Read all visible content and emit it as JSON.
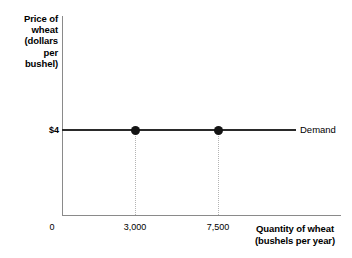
{
  "chart_data": {
    "type": "line",
    "title": "",
    "ylabel": "Price of wheat (dollars per bushel)",
    "xlabel": "Quantity of wheat (bushels per year)",
    "ylabel_lines": [
      "Price of",
      "wheat",
      "(dollars",
      "per",
      "bushel)"
    ],
    "xlabel_lines": [
      "Quantity of wheat",
      "(bushels per year)"
    ],
    "x_ticks": [
      "0",
      "3,000",
      "7,500"
    ],
    "x_tick_values": [
      0,
      3000,
      7500
    ],
    "y_ticks": [
      "$4"
    ],
    "y_tick_values": [
      4
    ],
    "xlim": [
      0,
      10000
    ],
    "ylim": [
      0,
      8
    ],
    "grid": "dotted-droplines",
    "legend_position": "right-of-line",
    "series": [
      {
        "name": "Demand",
        "label": "Demand",
        "kind": "horizontal-line",
        "y": 4,
        "x_start": 0,
        "x_end": 8400,
        "color": "#2a2a2a",
        "points": [
          {
            "x": 3000,
            "y": 4
          },
          {
            "x": 7500,
            "y": 4
          }
        ]
      }
    ],
    "annotations": [
      {
        "name": "droplines",
        "at_x": [
          3000,
          7500
        ],
        "style": "dotted",
        "color": "#b4b4b4"
      }
    ],
    "colors": {
      "axis": "#8a8a8a",
      "curve": "#2a2a2a",
      "marker": "#141414",
      "gridline": "#b4b4b4",
      "text": "#000000",
      "background": "#ffffff"
    }
  }
}
